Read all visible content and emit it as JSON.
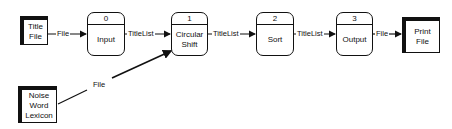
{
  "diagram": {
    "files": [
      {
        "id": "title-file",
        "label": "Title File",
        "lines": [
          "Title",
          "File"
        ]
      },
      {
        "id": "print-file",
        "label": "Print File",
        "lines": [
          "Print",
          "File"
        ]
      },
      {
        "id": "noise-word-lexicon",
        "label": "Noise Word Lexicon",
        "lines": [
          "Noise",
          "Word",
          "Lexicon"
        ]
      }
    ],
    "processes": [
      {
        "number": "0",
        "lines": [
          "Input"
        ]
      },
      {
        "number": "1",
        "lines": [
          "Circular",
          "Shift"
        ]
      },
      {
        "number": "2",
        "lines": [
          "Sort"
        ]
      },
      {
        "number": "3",
        "lines": [
          "Output"
        ]
      }
    ],
    "flows": [
      {
        "from": "Title File",
        "to": "Input",
        "label": "File"
      },
      {
        "from": "Input",
        "to": "Circular Shift",
        "label": "TitleList"
      },
      {
        "from": "Circular Shift",
        "to": "Sort",
        "label": "TitleList"
      },
      {
        "from": "Sort",
        "to": "Output",
        "label": "TitleList"
      },
      {
        "from": "Output",
        "to": "Print File",
        "label": "File"
      },
      {
        "from": "Noise Word Lexicon",
        "to": "Circular Shift",
        "label": "File"
      }
    ]
  }
}
